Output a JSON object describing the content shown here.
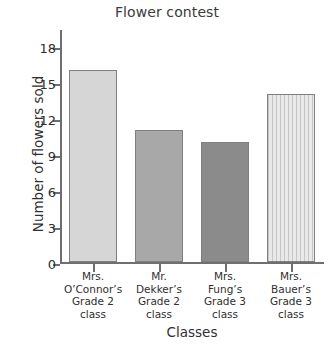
{
  "chart_data": {
    "type": "bar",
    "title": "Flower contest",
    "xlabel": "Classes",
    "ylabel": "Number of flowers sold",
    "categories": [
      "Mrs. O’Connor’s Grade 2 class",
      "Mr. Dekker’s Grade 2 class",
      "Mrs. Fung’s Grade 3 class",
      "Mrs. Bauer’s Grade 3 class"
    ],
    "category_lines": [
      [
        "Mrs.",
        "O’Connor’s",
        "Grade 2",
        "class"
      ],
      [
        "Mr.",
        "Dekker’s",
        "Grade 2",
        "class"
      ],
      [
        "Mrs.",
        "Fung’s",
        "Grade 3",
        "class"
      ],
      [
        "Mrs.",
        "Bauer’s",
        "Grade 3",
        "class"
      ]
    ],
    "values": [
      16,
      11,
      10,
      14
    ],
    "bar_colors": [
      "#d6d6d6",
      "#a8a8a8",
      "#8b8b8b",
      "#e9e9e9"
    ],
    "bar_border_color": "#808080",
    "ylim": [
      0,
      19.5
    ],
    "yticks": [
      0,
      3,
      6,
      9,
      12,
      15,
      18
    ],
    "ytick_labels": [
      "0",
      "3",
      "6",
      "9",
      "12",
      "15",
      "18"
    ],
    "grid": false,
    "legend": "none"
  }
}
